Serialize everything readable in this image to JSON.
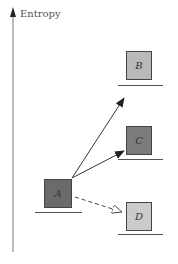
{
  "axis": {
    "label": "Entropy"
  },
  "states": [
    {
      "id": "A",
      "label": "A",
      "fill": "#6b6b6b",
      "x": 44,
      "y": 179,
      "base_x": 35,
      "base_y": 212,
      "base_w": 47
    },
    {
      "id": "B",
      "label": "B",
      "fill": "#b9b9b9",
      "x": 126,
      "y": 51,
      "base_x": 118,
      "base_y": 85,
      "base_w": 45
    },
    {
      "id": "C",
      "label": "C",
      "fill": "#7c7c7c",
      "x": 126,
      "y": 126,
      "base_x": 118,
      "base_y": 159,
      "base_w": 45
    },
    {
      "id": "D",
      "label": "D",
      "fill": "#cbcbcb",
      "x": 126,
      "y": 202,
      "base_x": 118,
      "base_y": 234,
      "base_w": 45
    }
  ],
  "transitions": [
    {
      "from": "A",
      "to": "B",
      "style": "solid"
    },
    {
      "from": "A",
      "to": "C",
      "style": "solid"
    },
    {
      "from": "A",
      "to": "D",
      "style": "dashed-open-head"
    }
  ]
}
